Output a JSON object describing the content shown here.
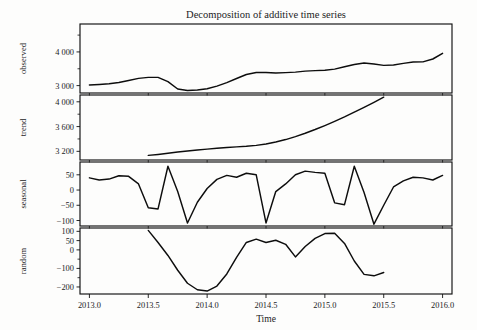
{
  "chart_data": {
    "type": "line",
    "title": "Decomposition of additive time series",
    "xlabel": "Time",
    "ylabel": "",
    "grid": false,
    "legend": "none",
    "xlim": [
      2012.92,
      2016.08
    ],
    "xticks": [
      2013.0,
      2013.5,
      2014.0,
      2014.5,
      2015.0,
      2015.5,
      2016.0
    ],
    "xtick_labels": [
      "2013.0",
      "2013.5",
      "2014.0",
      "2014.5",
      "2015.0",
      "2015.5",
      "2016.0"
    ],
    "panels": [
      {
        "name": "observed",
        "ylabel": "observed",
        "ylim": [
          2780,
          4830
        ],
        "yticks": [
          3000,
          4000
        ],
        "ytick_labels": [
          "3 000",
          "4 000"
        ],
        "yticks_minor": [
          3500,
          4500
        ],
        "x": [
          2013.0,
          2013.083,
          2013.167,
          2013.25,
          2013.333,
          2013.417,
          2013.5,
          2013.583,
          2013.667,
          2013.75,
          2013.833,
          2013.917,
          2014.0,
          2014.083,
          2014.167,
          2014.25,
          2014.333,
          2014.417,
          2014.5,
          2014.583,
          2014.667,
          2014.75,
          2014.833,
          2014.917,
          2015.0,
          2015.083,
          2015.167,
          2015.25,
          2015.333,
          2015.417,
          2015.5,
          2015.583,
          2015.667,
          2015.75,
          2015.833,
          2015.917,
          2016.0
        ],
        "values": [
          3020,
          3035,
          3055,
          3090,
          3150,
          3215,
          3245,
          3245,
          3120,
          2900,
          2855,
          2870,
          2905,
          2985,
          3090,
          3210,
          3330,
          3390,
          3390,
          3375,
          3385,
          3400,
          3430,
          3445,
          3455,
          3490,
          3560,
          3625,
          3670,
          3640,
          3600,
          3610,
          3660,
          3700,
          3705,
          3790,
          3960
        ]
      },
      {
        "name": "trend",
        "ylabel": "trend",
        "ylim": [
          3060,
          4110
        ],
        "yticks": [
          3200,
          3600,
          4000
        ],
        "ytick_labels": [
          "3 200",
          "3 600",
          "4 000"
        ],
        "yticks_minor": [
          3400,
          3800
        ],
        "x": [
          2013.5,
          2013.583,
          2013.667,
          2013.75,
          2013.833,
          2013.917,
          2014.0,
          2014.083,
          2014.167,
          2014.25,
          2014.333,
          2014.417,
          2014.5,
          2014.583,
          2014.667,
          2014.75,
          2014.833,
          2014.917,
          2015.0,
          2015.083,
          2015.167,
          2015.25,
          2015.333,
          2015.417,
          2015.5
        ],
        "values": [
          3135,
          3150,
          3168,
          3188,
          3206,
          3222,
          3236,
          3250,
          3262,
          3272,
          3282,
          3296,
          3318,
          3350,
          3390,
          3438,
          3492,
          3552,
          3616,
          3684,
          3756,
          3832,
          3910,
          3992,
          4075
        ]
      },
      {
        "name": "seasonal",
        "ylabel": "seasonal",
        "ylim": [
          -118,
          92
        ],
        "yticks": [
          -100,
          -50,
          0,
          50
        ],
        "ytick_labels": [
          "−100",
          "−50",
          "0",
          "50"
        ],
        "yticks_minor": [],
        "x": [
          2013.0,
          2013.083,
          2013.167,
          2013.25,
          2013.333,
          2013.417,
          2013.5,
          2013.583,
          2013.667,
          2013.75,
          2013.833,
          2013.917,
          2014.0,
          2014.083,
          2014.167,
          2014.25,
          2014.333,
          2014.417,
          2014.5,
          2014.583,
          2014.667,
          2014.75,
          2014.833,
          2014.917,
          2015.0,
          2015.083,
          2015.167,
          2015.25,
          2015.333,
          2015.417,
          2015.5,
          2015.583,
          2015.667,
          2015.75,
          2015.833,
          2015.917,
          2016.0
        ],
        "values": [
          40,
          33,
          36,
          47,
          45,
          20,
          -58,
          -62,
          78,
          -5,
          -108,
          -40,
          5,
          35,
          48,
          42,
          55,
          50,
          -108,
          -5,
          20,
          50,
          62,
          58,
          55,
          -42,
          -48,
          78,
          -8,
          -112,
          -50,
          10,
          30,
          42,
          40,
          33,
          48
        ]
      },
      {
        "name": "random",
        "ylabel": "random",
        "ylim": [
          -238,
          118
        ],
        "yticks": [
          -200,
          -100,
          0,
          50,
          100
        ],
        "ytick_labels": [
          "−200",
          "−100",
          "0",
          "50",
          "100"
        ],
        "yticks_minor": [
          -150,
          -50
        ],
        "x": [
          2013.5,
          2013.583,
          2013.667,
          2013.75,
          2013.833,
          2013.917,
          2014.0,
          2014.083,
          2014.167,
          2014.25,
          2014.333,
          2014.417,
          2014.5,
          2014.583,
          2014.667,
          2014.75,
          2014.833,
          2014.917,
          2015.0,
          2015.083,
          2015.167,
          2015.25,
          2015.333,
          2015.417,
          2015.5
        ],
        "values": [
          105,
          40,
          -30,
          -110,
          -180,
          -215,
          -222,
          -195,
          -130,
          -40,
          40,
          58,
          40,
          52,
          30,
          -38,
          18,
          62,
          88,
          90,
          35,
          -60,
          -132,
          -140,
          -122
        ]
      }
    ]
  },
  "panel_geometry": {
    "plot_left": 80,
    "plot_right": 452,
    "title_y": 18,
    "xlabel_y": 322,
    "rows": [
      {
        "name": "observed",
        "top": 24,
        "bottom": 93
      },
      {
        "name": "trend",
        "top": 95,
        "bottom": 160
      },
      {
        "name": "seasonal",
        "top": 162,
        "bottom": 226
      },
      {
        "name": "random",
        "top": 228,
        "bottom": 294
      }
    ]
  }
}
